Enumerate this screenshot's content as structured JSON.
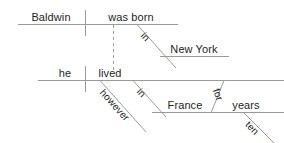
{
  "diagram": {
    "type": "reed-kellogg-sentence-diagram",
    "sentence_clause_1": "Baldwin was born in New York",
    "sentence_clause_2": "he lived however in France for ten years",
    "colors": {
      "line": "#9a9a9a",
      "text": "#231f20",
      "background": "#ffffff"
    },
    "clauses": [
      {
        "id": "clause-1",
        "subject": "Baldwin",
        "predicate": "was born",
        "modifiers": [
          {
            "word": "in",
            "type": "preposition"
          },
          {
            "word": "New York",
            "type": "object-of-preposition"
          }
        ]
      },
      {
        "id": "clause-2",
        "subject": "he",
        "predicate": "lived",
        "modifiers": [
          {
            "word": "however",
            "type": "adverb"
          },
          {
            "word": "in",
            "type": "preposition"
          },
          {
            "word": "France",
            "type": "object-of-preposition"
          },
          {
            "word": "for",
            "type": "preposition"
          },
          {
            "word": "years",
            "type": "object-of-preposition"
          },
          {
            "word": "ten",
            "type": "adjective"
          }
        ]
      }
    ],
    "labels": {
      "baldwin": "Baldwin",
      "was_born": "was born",
      "in_1": "in",
      "new_york": "New York",
      "he": "he",
      "lived": "lived",
      "however": "however",
      "in_2": "in",
      "france": "France",
      "for": "for",
      "years": "years",
      "ten": "ten"
    }
  }
}
